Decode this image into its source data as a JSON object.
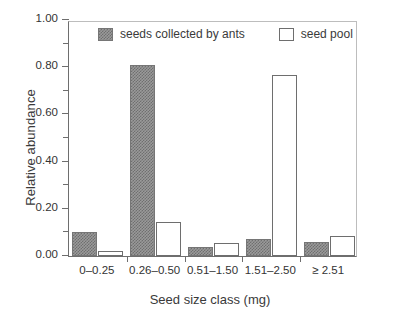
{
  "chart_data": {
    "type": "bar",
    "title": "",
    "xlabel": "Seed size class (mg)",
    "ylabel": "Relative abundance",
    "categories": [
      "0–0.25",
      "0.26–0.50",
      "0.51–1.50",
      "1.51–2.50",
      "≥ 2.51"
    ],
    "series": [
      {
        "name": "seeds collected by ants",
        "values": [
          0.1,
          0.81,
          0.04,
          0.07,
          0.06
        ],
        "fill": "#9a9a9a",
        "pattern": "checkered-gray"
      },
      {
        "name": "seed pool",
        "values": [
          0.02,
          0.145,
          0.055,
          0.765,
          0.085
        ],
        "fill": "#ffffff",
        "pattern": "solid-white"
      }
    ],
    "ylim": [
      0.0,
      1.0
    ],
    "ytick_values": [
      0.0,
      0.1,
      0.2,
      0.3,
      0.4,
      0.5,
      0.6,
      0.7,
      0.8,
      0.9,
      1.0
    ],
    "ytick_labels": [
      "0.00",
      "",
      "0.20",
      "",
      "0.40",
      "",
      "0.60",
      "",
      "0.80",
      "",
      "1.00"
    ],
    "grid": false,
    "legend_position": "top-inside"
  },
  "legend": {
    "items": [
      {
        "label": "seeds collected by ants",
        "swatch": "ants"
      },
      {
        "label": "seed pool",
        "swatch": "pool"
      }
    ]
  }
}
